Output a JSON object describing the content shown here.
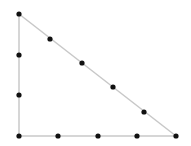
{
  "diagram": {
    "type": "right-triangle-with-points",
    "colors": {
      "edge": "#c8c8c8",
      "point": "#111111",
      "background": "#ffffff"
    },
    "edge_width": 1.5,
    "point_radius": 2.6,
    "vertices": [
      {
        "name": "top",
        "x": 19,
        "y": 14
      },
      {
        "name": "bottom-left",
        "x": 19,
        "y": 136
      },
      {
        "name": "bottom-right",
        "x": 176,
        "y": 136
      }
    ],
    "edges": [
      {
        "name": "left-leg",
        "from": 0,
        "to": 1
      },
      {
        "name": "bottom-leg",
        "from": 1,
        "to": 2
      },
      {
        "name": "hypotenuse",
        "from": 0,
        "to": 2
      }
    ],
    "points": [
      {
        "x": 19,
        "y": 14
      },
      {
        "x": 19,
        "y": 55
      },
      {
        "x": 19,
        "y": 95
      },
      {
        "x": 19,
        "y": 136
      },
      {
        "x": 58,
        "y": 136
      },
      {
        "x": 98,
        "y": 136
      },
      {
        "x": 137,
        "y": 136
      },
      {
        "x": 176,
        "y": 136
      },
      {
        "x": 50,
        "y": 39
      },
      {
        "x": 82,
        "y": 63
      },
      {
        "x": 113,
        "y": 87
      },
      {
        "x": 144,
        "y": 112
      }
    ]
  }
}
